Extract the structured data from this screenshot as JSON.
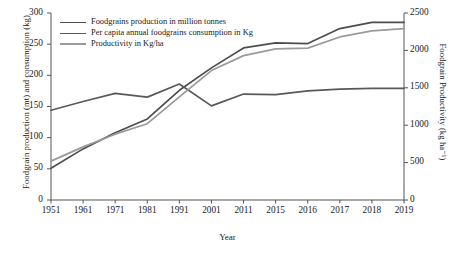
{
  "chart_data": {
    "type": "line",
    "title": "",
    "xlabel": "Year",
    "ylabel": "Foodgrain production (mt) and consumption (kg)",
    "ylabel_right": "Foodgrain Productivity (kg ha⁻¹)",
    "categories": [
      "1951",
      "1961",
      "1971",
      "1981",
      "1991",
      "2001",
      "2011",
      "2015",
      "2016",
      "2017",
      "2018",
      "2019"
    ],
    "ylim": [
      0,
      300
    ],
    "yticks": [
      "0",
      "50",
      "100",
      "150",
      "200",
      "250",
      "300"
    ],
    "ylim_right": [
      0,
      2500
    ],
    "yticks_right": [
      "0",
      "500",
      "1000",
      "1500",
      "2000",
      "2500"
    ],
    "grid": false,
    "legend_position": "top-left",
    "series": [
      {
        "name": "Foodgrains production in million tonnes",
        "axis": "left",
        "color": "#4d4d4d",
        "values": [
          51,
          82,
          108,
          130,
          176,
          212,
          244,
          252,
          251,
          275,
          285,
          285
        ]
      },
      {
        "name": "Per capita annual foodgrains consumption in Kg",
        "axis": "left",
        "color": "#595959",
        "values": [
          144,
          158,
          171,
          165,
          186,
          151,
          170,
          169,
          175,
          178,
          179,
          179
        ]
      },
      {
        "name": "Productivity in Kg/ha",
        "axis": "right",
        "color": "#9a9a9a",
        "values": [
          520,
          710,
          880,
          1020,
          1380,
          1730,
          1930,
          2020,
          2030,
          2180,
          2260,
          2290
        ]
      }
    ]
  },
  "legend": {
    "items": [
      {
        "label": "Foodgrains production in million tonnes",
        "color": "#4d4d4d"
      },
      {
        "label": "Per capita annual foodgrains consumption in Kg",
        "color": "#595959"
      },
      {
        "label": "Productivity in Kg/ha",
        "color": "#9a9a9a"
      }
    ]
  },
  "axis_color": "#555555"
}
